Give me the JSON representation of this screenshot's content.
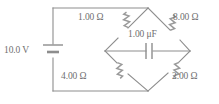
{
  "figure": {
    "name": "wheatstone-bridge-circuit",
    "background_color": "#ffffff",
    "line_color": "#8d8d8d",
    "text_color": "#6f6f6f"
  },
  "components": {
    "source": {
      "type": "battery",
      "label": "10.0 V",
      "position": "left-branch"
    },
    "resistor_top_left": {
      "type": "resistor",
      "label": "1.00 Ω",
      "position": "upper-left-arm"
    },
    "resistor_top_right": {
      "type": "resistor",
      "label": "8.00 Ω",
      "position": "upper-right-arm"
    },
    "resistor_bottom_left": {
      "type": "resistor",
      "label": "4.00 Ω",
      "position": "lower-left-arm"
    },
    "resistor_bottom_right": {
      "type": "resistor",
      "label": "2.00 Ω",
      "position": "lower-right-arm"
    },
    "capacitor_bridge": {
      "type": "capacitor",
      "label": "1.00 μF",
      "position": "bridge-middle"
    }
  }
}
